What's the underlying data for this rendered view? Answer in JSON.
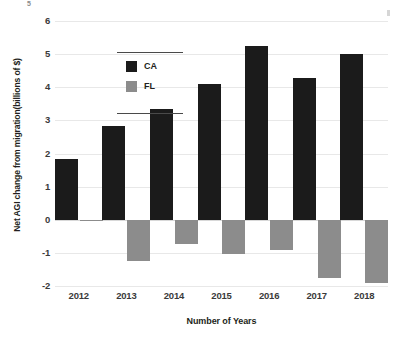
{
  "chart_data": {
    "type": "bar",
    "title": "",
    "subtitle": "",
    "xlabel": "Number of Years",
    "ylabel": "Net AGI change from migration(billions of $)",
    "categories": [
      "2012",
      "2013",
      "2014",
      "2015",
      "2016",
      "2017",
      "2018"
    ],
    "series": [
      {
        "name": "CA",
        "color": "#1b1b1b",
        "values": [
          1.82,
          2.82,
          3.35,
          4.1,
          5.25,
          4.28,
          5.0
        ]
      },
      {
        "name": "FL",
        "color": "#8c8c8c",
        "values": [
          -0.05,
          -1.25,
          -0.72,
          -1.03,
          -0.9,
          -1.75,
          -1.9
        ]
      }
    ],
    "ylim": [
      -2,
      6
    ],
    "yticks": [
      6,
      5,
      4,
      3,
      2,
      1,
      0,
      -1,
      -2
    ],
    "ytick_labels": [
      "6",
      "5",
      "4",
      "3",
      "2",
      "1",
      "0",
      "-1",
      "-2"
    ],
    "grid": true,
    "legend_position": "upper-left",
    "zero_line": 0
  },
  "legend": {
    "entries": [
      {
        "label": "CA",
        "swatch": "ca"
      },
      {
        "label": "FL",
        "swatch": "fl"
      }
    ]
  },
  "artifacts": {
    "top_fragment": "5"
  }
}
